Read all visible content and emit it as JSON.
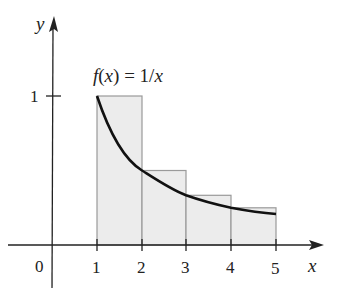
{
  "figure": {
    "function_label": "f(x) = 1/x",
    "function_label_parts": {
      "f": "f",
      "open": "(",
      "x": "x",
      "close": ")",
      "eq": " = 1/",
      "x2": "x"
    },
    "axes": {
      "x_label": "x",
      "y_label": "y",
      "origin_label": "0",
      "x_ticks": [
        "1",
        "2",
        "3",
        "4",
        "5"
      ],
      "y_ticks": [
        "1"
      ]
    },
    "rectangles": [
      {
        "x0": 1,
        "x1": 2,
        "height": 1
      },
      {
        "x0": 2,
        "x1": 3,
        "height": 0.5
      },
      {
        "x0": 3,
        "x1": 4,
        "height": 0.3333
      },
      {
        "x0": 4,
        "x1": 5,
        "height": 0.25
      }
    ],
    "curve": {
      "expression": "1/x",
      "domain": [
        1,
        5
      ]
    },
    "colors": {
      "rect_fill": "#ececec",
      "rect_stroke": "#9a9a9a",
      "curve": "#111111",
      "axis": "#222222"
    }
  }
}
